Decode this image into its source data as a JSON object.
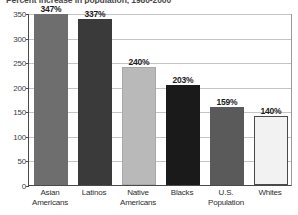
{
  "chart_data": {
    "type": "bar",
    "title": "Percent increase in population, 1980-2000",
    "xlabel": "",
    "ylabel": "",
    "categories": [
      "Asian Americans",
      "Latinos",
      "Native Americans",
      "Blacks",
      "U.S. Population",
      "Whites"
    ],
    "category_lines": [
      [
        "Asian",
        "Americans"
      ],
      [
        "Latinos",
        ""
      ],
      [
        "Native",
        "Americans"
      ],
      [
        "Blacks",
        ""
      ],
      [
        "U.S.",
        "Population"
      ],
      [
        "Whites",
        ""
      ]
    ],
    "values": [
      347,
      337,
      240,
      203,
      159,
      140
    ],
    "data_labels": [
      "347%",
      "337%",
      "240%",
      "203%",
      "159%",
      "140%"
    ],
    "bar_colors": [
      "#6e6e6e",
      "#3a3a3a",
      "#b9b9b9",
      "#1a1a1a",
      "#5a5a5a",
      "#f2f2f2"
    ],
    "bar_border_colors": [
      "#6e6e6e",
      "#3a3a3a",
      "#a8a8a8",
      "#1a1a1a",
      "#5a5a5a",
      "#4a4a4a"
    ],
    "ylim": [
      0,
      350
    ],
    "yticks": [
      0,
      50,
      100,
      150,
      200,
      250,
      300,
      350
    ],
    "ytick_labels": [
      "0",
      "50",
      "100",
      "150",
      "200",
      "250",
      "300",
      "350"
    ],
    "grid": true,
    "legend": "none",
    "axis_color": "#4a4a4a",
    "grid_color": "#c4c4c4"
  }
}
